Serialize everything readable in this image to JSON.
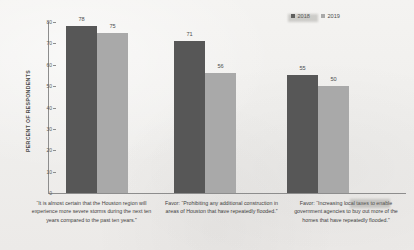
{
  "chart_data": {
    "type": "bar",
    "title": "",
    "xlabel": "",
    "ylabel": "PERCENT OF RESPONDENTS",
    "ylim": [
      0,
      80
    ],
    "yticks": [
      80,
      70,
      60,
      50,
      40,
      30,
      20,
      10,
      0
    ],
    "grid": false,
    "legend_position": "top-right",
    "categories": [
      "“It is almost certain that the Houston region will experience more severe storms during the next ten years compared to the past ten years.”",
      "Favor: “Prohibiting any additional construction in areas of Houston that have repeatedly flooded.”",
      "Favor: “Increasing local taxes to enable government agencies to buy out more of the homes that have repeatedly flooded.”"
    ],
    "series": [
      {
        "name": "2018",
        "color": "#575757",
        "values": [
          78,
          71,
          55
        ]
      },
      {
        "name": "2019",
        "color": "#a9a9a9",
        "values": [
          75,
          56,
          50
        ]
      }
    ]
  },
  "colors": {
    "background": "#f1f0ee",
    "axis": "#8d8d8d",
    "text": "#3f3f3f",
    "series_2018": "#575757",
    "series_2019": "#a9a9a9"
  }
}
